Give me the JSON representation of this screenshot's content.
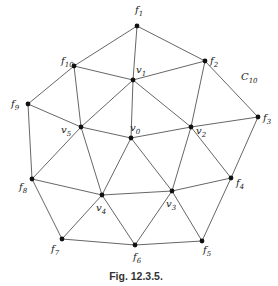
{
  "figure": {
    "caption": "Fig. 12.3.5.",
    "cycle_label": {
      "base": "C",
      "sub": "10",
      "x": 241,
      "y": 80
    },
    "nodes": [
      {
        "id": "f1",
        "base": "f",
        "sub": "1",
        "x": 137,
        "y": 26,
        "lx": 135,
        "ly": 13
      },
      {
        "id": "f2",
        "base": "f",
        "sub": "2",
        "x": 205,
        "y": 61,
        "lx": 210,
        "ly": 64
      },
      {
        "id": "f3",
        "base": "f",
        "sub": "3",
        "x": 258,
        "y": 117,
        "lx": 263,
        "ly": 121
      },
      {
        "id": "f4",
        "base": "f",
        "sub": "4",
        "x": 231,
        "y": 178,
        "lx": 236,
        "ly": 186
      },
      {
        "id": "f5",
        "base": "f",
        "sub": "5",
        "x": 202,
        "y": 241,
        "lx": 203,
        "ly": 253
      },
      {
        "id": "f6",
        "base": "f",
        "sub": "6",
        "x": 135,
        "y": 245,
        "lx": 133,
        "ly": 260
      },
      {
        "id": "f7",
        "base": "f",
        "sub": "7",
        "x": 62,
        "y": 239,
        "lx": 51,
        "ly": 252
      },
      {
        "id": "f8",
        "base": "f",
        "sub": "8",
        "x": 32,
        "y": 179,
        "lx": 19,
        "ly": 190
      },
      {
        "id": "f9",
        "base": "f",
        "sub": "9",
        "x": 28,
        "y": 104,
        "lx": 11,
        "ly": 107
      },
      {
        "id": "f10",
        "base": "f",
        "sub": "10",
        "x": 74,
        "y": 66,
        "lx": 61,
        "ly": 64
      },
      {
        "id": "v0",
        "base": "v",
        "sub": "0",
        "x": 131,
        "y": 138,
        "lx": 130,
        "ly": 131
      },
      {
        "id": "v1",
        "base": "v",
        "sub": "1",
        "x": 133,
        "y": 80,
        "lx": 136,
        "ly": 73
      },
      {
        "id": "v2",
        "base": "v",
        "sub": "2",
        "x": 191,
        "y": 127,
        "lx": 196,
        "ly": 134
      },
      {
        "id": "v3",
        "base": "v",
        "sub": "3",
        "x": 172,
        "y": 191,
        "lx": 166,
        "ly": 207
      },
      {
        "id": "v4",
        "base": "v",
        "sub": "4",
        "x": 102,
        "y": 195,
        "lx": 96,
        "ly": 211
      },
      {
        "id": "v5",
        "base": "v",
        "sub": "5",
        "x": 81,
        "y": 127,
        "lx": 61,
        "ly": 133
      }
    ],
    "edges": [
      [
        "f1",
        "f10"
      ],
      [
        "f1",
        "v1"
      ],
      [
        "f1",
        "f2"
      ],
      [
        "f10",
        "v1"
      ],
      [
        "v1",
        "f2"
      ],
      [
        "f10",
        "f9"
      ],
      [
        "f10",
        "v5"
      ],
      [
        "v1",
        "v5"
      ],
      [
        "v1",
        "v0"
      ],
      [
        "v1",
        "v2"
      ],
      [
        "f2",
        "v2"
      ],
      [
        "f2",
        "f3"
      ],
      [
        "f9",
        "v5"
      ],
      [
        "f9",
        "f8"
      ],
      [
        "v5",
        "v0"
      ],
      [
        "v0",
        "v2"
      ],
      [
        "v2",
        "f3"
      ],
      [
        "f3",
        "f4"
      ],
      [
        "v5",
        "f8"
      ],
      [
        "v5",
        "v4"
      ],
      [
        "v0",
        "v4"
      ],
      [
        "v0",
        "v3"
      ],
      [
        "v2",
        "v3"
      ],
      [
        "v2",
        "f4"
      ],
      [
        "f8",
        "v4"
      ],
      [
        "v4",
        "v3"
      ],
      [
        "v3",
        "f4"
      ],
      [
        "f8",
        "f7"
      ],
      [
        "v4",
        "f7"
      ],
      [
        "v4",
        "f6"
      ],
      [
        "v3",
        "f6"
      ],
      [
        "v3",
        "f5"
      ],
      [
        "f4",
        "f5"
      ],
      [
        "f7",
        "f6"
      ],
      [
        "f6",
        "f5"
      ]
    ]
  }
}
